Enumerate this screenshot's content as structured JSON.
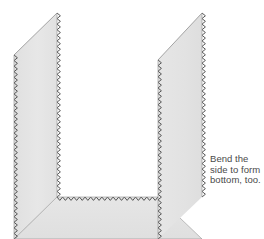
{
  "figure": {
    "title": "Bend the side to form bottom, too",
    "kind": "folded-sheet-diagram",
    "background_color": "#ffffff",
    "panel_fill": "#e4e4e4",
    "panel_fill_light": "#ebebeb",
    "panel_fill_dark": "#dcdcdc",
    "edge_line_color": "#9a9a9a",
    "zigzag_color": "#4d4d4d",
    "fold_line_color": "#b4b4b4",
    "panels": [
      {
        "name": "left-side-panel",
        "description": "Upright left side of the box, slanted top edge, zigzag cut edges on left and right",
        "points": "14,55 57,13 57,197 14,239"
      },
      {
        "name": "right-side-panel",
        "description": "Upright right side of the box, slanted top edge, zigzag cut edges on left and right",
        "points": "158,60 202,13 202,197 158,239"
      },
      {
        "name": "bottom-panel",
        "description": "Horizontal bottom of the box seen in perspective, zigzag edges top and bottom",
        "points": "57,197 158,197 202,239 14,239"
      }
    ],
    "fold_lines": [
      {
        "name": "left-bottom-fold",
        "from": "14,239",
        "to": "57,197"
      },
      {
        "name": "right-bottom-fold",
        "from": "158,197",
        "to": "202,239"
      }
    ]
  },
  "caption": {
    "text": "Bend the\nside to form\nbottom, too.",
    "lines": [
      "Bend the",
      "side to form",
      "bottom, too."
    ],
    "color": "#4a4a4a"
  }
}
